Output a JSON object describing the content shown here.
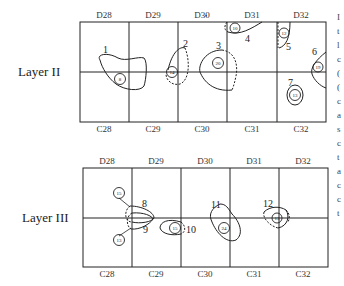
{
  "layers": [
    {
      "label": "Layer II",
      "top_columns": [
        "D28",
        "D29",
        "D30",
        "D31",
        "D32"
      ],
      "bottom_columns": [
        "C28",
        "C29",
        "C30",
        "C31",
        "C32"
      ],
      "features": [
        {
          "id": "1",
          "circle": "8"
        },
        {
          "id": "2",
          "circle": "14"
        },
        {
          "id": "3",
          "circle": "20"
        },
        {
          "id": "4",
          "circle": "10"
        },
        {
          "id": "5",
          "circle": "12"
        },
        {
          "id": "6",
          "circle": "19"
        },
        {
          "id": "7",
          "circle": "13"
        }
      ]
    },
    {
      "label": "Layer III",
      "top_columns": [
        "D28",
        "D29",
        "D30",
        "D31",
        "D32"
      ],
      "bottom_columns": [
        "C28",
        "C29",
        "C30",
        "C31",
        "C32"
      ],
      "features": [
        {
          "id": "8",
          "circle": "15"
        },
        {
          "id": "9",
          "circle": "13"
        },
        {
          "id": "10",
          "circle": "15"
        },
        {
          "id": "11",
          "circle": "24"
        },
        {
          "id": "12",
          "circle": "13"
        }
      ]
    }
  ],
  "edge_fragments": [
    "I",
    "t",
    "l",
    "c",
    "(",
    "(",
    "c",
    "a",
    "s",
    "c",
    "t",
    "a",
    "c",
    "c",
    "t"
  ]
}
